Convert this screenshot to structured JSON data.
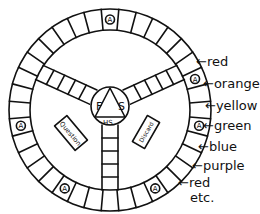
{
  "board": {
    "center_labels": {
      "left": "F",
      "right": "S",
      "bottom": "HS"
    },
    "cards": [
      {
        "label": "Question",
        "position": "left"
      },
      {
        "label": "Discard",
        "position": "right"
      }
    ],
    "ring_spaces": 36,
    "special_space_symbol": "A"
  },
  "color_sequence": {
    "labels": [
      "red",
      "orange",
      "yellow",
      "green",
      "blue",
      "purple",
      "red",
      "etc."
    ],
    "arrow_glyph": "←"
  }
}
